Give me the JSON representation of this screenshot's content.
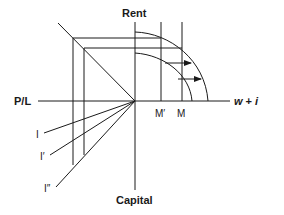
{
  "figure": {
    "axes": {
      "top": "Rent",
      "bottom": "Capital",
      "left": "P/L",
      "right_main": "w",
      "right_op": " + ",
      "right_italic": "i"
    },
    "markers": {
      "m_prime": "M′",
      "m": "M"
    },
    "rays": {
      "i1": "I",
      "i2": "I′",
      "i3": "I″"
    },
    "colors": {
      "line": "#1a1a1a",
      "background": "#ffffff"
    }
  }
}
